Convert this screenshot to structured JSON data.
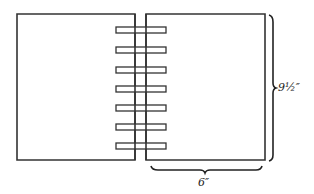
{
  "diagram": {
    "ring_count": 7,
    "dimensions": {
      "height_label": "9½″",
      "width_label": "6″"
    },
    "colors": {
      "stroke": "#333333",
      "background": "#ffffff"
    }
  }
}
